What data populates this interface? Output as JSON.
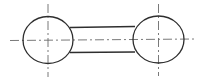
{
  "diagram": {
    "type": "technical-drawing",
    "colors": {
      "background": "#ffffff",
      "outline": "#2e2e2e",
      "centerline": "#6a6a6a"
    },
    "circles": [
      {
        "id": "left",
        "cx": 48,
        "cy": 40,
        "rx": 25,
        "ry": 23.5
      },
      {
        "id": "right",
        "cx": 158.5,
        "cy": 39.5,
        "rx": 25.5,
        "ry": 23.5
      }
    ],
    "link": {
      "top_line": {
        "x1": 70,
        "y1": 27.5,
        "x2": 135,
        "y2": 26.5
      },
      "bottom_line": {
        "x1": 70,
        "y1": 52.5,
        "x2": 135,
        "y2": 52
      }
    },
    "centerlines": {
      "horizontal": {
        "x1": 10,
        "y1": 40.5,
        "x2": 196,
        "y2": 39
      },
      "left_vertical": {
        "x1": 48,
        "y1": 4,
        "x2": 48,
        "y2": 77
      },
      "right_vertical": {
        "x1": 158.5,
        "y1": 4,
        "x2": 158.5,
        "y2": 76
      }
    }
  }
}
